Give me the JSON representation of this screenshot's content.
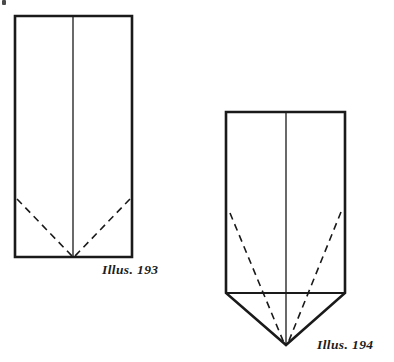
{
  "page": {
    "background_color": "#ffffff",
    "ink_color": "#1a1a1a",
    "width": 394,
    "height": 362
  },
  "figures": [
    {
      "id": "illus-193",
      "caption": "Illus. 193",
      "caption_position": {
        "x": 102,
        "y": 262
      },
      "shape": "rectangle",
      "description": "Upright rectangle divided by a vertical center crease, with two dashed diagonal fold lines running from the lower side edges down to the bottom center point.",
      "outline": {
        "left": 15,
        "top": 16,
        "right": 132,
        "bottom": 257
      },
      "solid_lines": [
        {
          "name": "rect-top",
          "x1": 15,
          "y1": 16,
          "x2": 132,
          "y2": 16
        },
        {
          "name": "rect-right",
          "x1": 132,
          "y1": 16,
          "x2": 132,
          "y2": 257
        },
        {
          "name": "rect-bottom",
          "x1": 132,
          "y1": 257,
          "x2": 15,
          "y2": 257
        },
        {
          "name": "rect-left",
          "x1": 15,
          "y1": 257,
          "x2": 15,
          "y2": 16
        },
        {
          "name": "center-crease",
          "x1": 73,
          "y1": 16,
          "x2": 73,
          "y2": 257
        }
      ],
      "dashed_lines": [
        {
          "name": "left-fold",
          "x1": 17,
          "y1": 199,
          "x2": 72,
          "y2": 256
        },
        {
          "name": "right-fold",
          "x1": 130,
          "y1": 199,
          "x2": 75,
          "y2": 256
        }
      ]
    },
    {
      "id": "illus-194",
      "caption": "Illus. 194",
      "caption_position": {
        "x": 317,
        "y": 337
      },
      "shape": "rectangle-with-point",
      "description": "Same rectangle with the lower corners folded forward to form a downward triangular point; dashed fold lines run from the side edges to the triangle apex.",
      "outline": {
        "left": 226,
        "top": 112,
        "right": 345,
        "bottom": 293,
        "apex_y": 345
      },
      "solid_lines": [
        {
          "name": "rect-top",
          "x1": 226,
          "y1": 112,
          "x2": 345,
          "y2": 112
        },
        {
          "name": "rect-right",
          "x1": 345,
          "y1": 112,
          "x2": 345,
          "y2": 293
        },
        {
          "name": "rect-left",
          "x1": 226,
          "y1": 112,
          "x2": 226,
          "y2": 293
        },
        {
          "name": "base-line",
          "x1": 226,
          "y1": 293,
          "x2": 345,
          "y2": 293
        },
        {
          "name": "point-left-edge",
          "x1": 226,
          "y1": 293,
          "x2": 286,
          "y2": 345
        },
        {
          "name": "point-right-edge",
          "x1": 345,
          "y1": 293,
          "x2": 286,
          "y2": 345
        },
        {
          "name": "center-crease",
          "x1": 286,
          "y1": 112,
          "x2": 286,
          "y2": 345
        }
      ],
      "dashed_lines": [
        {
          "name": "left-fold",
          "x1": 230,
          "y1": 213,
          "x2": 284,
          "y2": 343
        },
        {
          "name": "right-fold",
          "x1": 341,
          "y1": 212,
          "x2": 288,
          "y2": 343
        }
      ]
    }
  ],
  "artifacts": [
    {
      "name": "scan-speck",
      "x": 2,
      "y": 0,
      "width": 4,
      "height": 5
    }
  ],
  "style": {
    "outline_stroke_width": 2.6,
    "crease_stroke_width": 1.3,
    "dashed_stroke_width": 1.6,
    "dash_pattern": "7 5"
  }
}
